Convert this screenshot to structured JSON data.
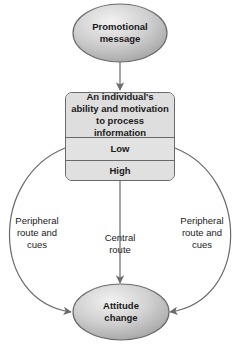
{
  "diagram": {
    "type": "flowchart",
    "title": "",
    "nodes": {
      "top": {
        "label": "Promotional\nmessage",
        "shape": "ellipse"
      },
      "process_box": {
        "header": "An individual's\nability and motivation\nto process information",
        "rows": [
          {
            "label": "Low"
          },
          {
            "label": "High"
          }
        ]
      },
      "bottom": {
        "label": "Attitude\nchange",
        "shape": "ellipse"
      }
    },
    "edges": {
      "left": {
        "label": "Peripheral\nroute and\ncues",
        "from": "Low",
        "to": "Attitude change"
      },
      "center": {
        "label": "Central\nroute",
        "from": "High",
        "to": "Attitude change"
      },
      "right": {
        "label": "Peripheral\nroute and\ncues",
        "from": "Low",
        "to": "Attitude change"
      }
    }
  },
  "colors": {
    "ellipse_fill_light": "#e8e8e8",
    "ellipse_fill_dark": "#a8a8a8",
    "box_fill": "#dcdcdc",
    "stroke": "#6a6a6a",
    "text": "#1a1a1a"
  }
}
